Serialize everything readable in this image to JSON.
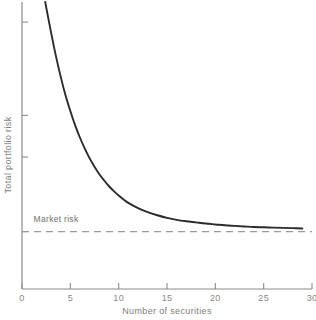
{
  "chart_data": {
    "type": "line",
    "title": "",
    "xlabel": "Number of securities",
    "ylabel": "Total portfolio risk",
    "xlim": [
      0,
      30
    ],
    "ylim": [
      0,
      10
    ],
    "grid": false,
    "legend_position": "none",
    "x_ticks": [
      "0",
      "5",
      "10",
      "15",
      "20",
      "25",
      "30"
    ],
    "x_tick_values": [
      0,
      5,
      10,
      15,
      20,
      25,
      30
    ],
    "y_ticks": [
      "",
      "",
      "",
      ""
    ],
    "y_tick_values": [
      2.0,
      4.6,
      6.05,
      9.3
    ],
    "series": [
      {
        "name": "Total portfolio risk",
        "color": "#2b2b2b",
        "x": [
          2.4,
          3.0,
          3.5,
          4.0,
          4.5,
          5.0,
          5.5,
          6.0,
          6.5,
          7.0,
          7.5,
          8.0,
          8.5,
          9.0,
          9.5,
          10.0,
          11.0,
          12.0,
          13.0,
          14.0,
          15.0,
          16.0,
          17.0,
          18.0,
          19.0,
          20.0,
          21.0,
          22.0,
          23.0,
          24.0,
          25.0,
          26.0,
          27.0,
          28.0,
          29.0
        ],
        "y": [
          10.0,
          8.95,
          8.13,
          7.4,
          6.75,
          6.2,
          5.7,
          5.27,
          4.89,
          4.55,
          4.26,
          4.0,
          3.78,
          3.58,
          3.41,
          3.26,
          3.0,
          2.82,
          2.68,
          2.57,
          2.48,
          2.41,
          2.36,
          2.32,
          2.28,
          2.25,
          2.22,
          2.2,
          2.18,
          2.16,
          2.15,
          2.14,
          2.13,
          2.12,
          2.11
        ]
      }
    ],
    "reference_lines": [
      {
        "name": "market-risk",
        "label": "Market risk",
        "orientation": "horizontal",
        "value": 2.0,
        "style": "dashed",
        "color": "#9a9a9a"
      }
    ],
    "annotations": [
      {
        "text": "Market risk",
        "x": 1.2,
        "y": 2.35
      }
    ]
  },
  "axes": {
    "x_axis_name": "Number of securities",
    "y_axis_name": "Total portfolio risk",
    "axis_color": "#8c8c8c"
  }
}
